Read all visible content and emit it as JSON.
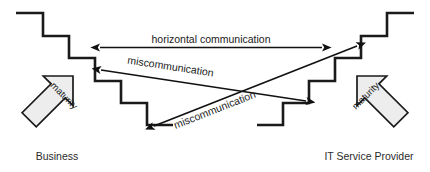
{
  "diagram": {
    "colors": {
      "background": "#ffffff",
      "stair_stroke": "#1a1a1a",
      "arrow_fill": "#ededed",
      "arrow_stroke": "#1a1a1a",
      "line_stroke": "#111111",
      "text": "#1a1a1a"
    },
    "entities": [
      {
        "id": "business",
        "label": "Business",
        "side": "left"
      },
      {
        "id": "it-service-provider",
        "label": "IT Service Provider",
        "side": "right"
      }
    ],
    "maturity_arrows": [
      {
        "id": "maturity-left",
        "label": "maturity",
        "direction": "up-left"
      },
      {
        "id": "maturity-right",
        "label": "maturity",
        "direction": "up-right"
      }
    ],
    "communication_arrows": [
      {
        "id": "horizontal-communication",
        "label": "horizontal communication",
        "kind": "double-headed",
        "orientation": "horizontal"
      },
      {
        "id": "miscommunication-upper",
        "label": "miscommunication",
        "kind": "double-headed",
        "orientation": "diagonal-descending"
      },
      {
        "id": "miscommunication-lower",
        "label": "miscommunication",
        "kind": "double-headed",
        "orientation": "diagonal-ascending"
      }
    ]
  }
}
